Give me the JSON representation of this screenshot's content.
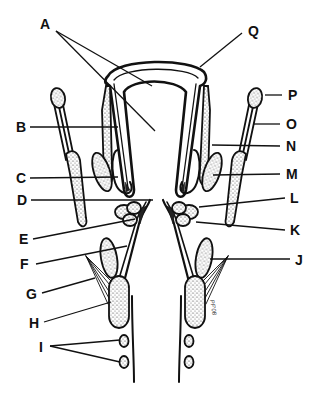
{
  "figure": {
    "type": "anatomical line drawing (coronal section)",
    "background": "#ffffff",
    "ink": "#111111",
    "labels": [
      {
        "id": "A",
        "text": "A",
        "x": 40,
        "y": 29,
        "side": "top-left",
        "targets": [
          [
            152,
            86
          ],
          [
            155,
            131
          ]
        ]
      },
      {
        "id": "B",
        "text": "B",
        "x": 16,
        "y": 131,
        "side": "left",
        "target": [
          118,
          127
        ]
      },
      {
        "id": "C",
        "text": "C",
        "x": 16,
        "y": 182,
        "side": "left",
        "target": [
          118,
          177
        ]
      },
      {
        "id": "D",
        "text": "D",
        "x": 17,
        "y": 205,
        "side": "left",
        "target": [
          153,
          200
        ]
      },
      {
        "id": "E",
        "text": "E",
        "x": 19,
        "y": 243,
        "side": "left",
        "target": [
          135,
          219
        ]
      },
      {
        "id": "F",
        "text": "F",
        "x": 19,
        "y": 268,
        "side": "left",
        "target": [
          127,
          246
        ]
      },
      {
        "id": "G",
        "text": "G",
        "x": 26,
        "y": 298,
        "side": "left",
        "target": [
          95,
          278
        ]
      },
      {
        "id": "H",
        "text": "H",
        "x": 29,
        "y": 327,
        "side": "left",
        "target": [
          111,
          302
        ]
      },
      {
        "id": "I",
        "text": "I",
        "x": 39,
        "y": 351,
        "side": "left",
        "targets": [
          [
            122,
            340
          ],
          [
            121,
            362
          ]
        ]
      },
      {
        "id": "J",
        "text": "J",
        "x": 296,
        "y": 268,
        "side": "right",
        "target": [
          210,
          259
        ]
      },
      {
        "id": "K",
        "text": "K",
        "x": 292,
        "y": 235,
        "side": "right",
        "target": [
          196,
          222
        ]
      },
      {
        "id": "L",
        "text": "L",
        "x": 292,
        "y": 203,
        "side": "right",
        "target": [
          199,
          207
        ]
      },
      {
        "id": "M",
        "text": "M",
        "x": 287,
        "y": 178,
        "side": "right",
        "target": [
          213,
          175
        ]
      },
      {
        "id": "N",
        "text": "N",
        "x": 287,
        "y": 151,
        "side": "right",
        "target": [
          212,
          145
        ]
      },
      {
        "id": "O",
        "text": "O",
        "x": 287,
        "y": 129,
        "side": "right",
        "target": [
          254,
          124
        ]
      },
      {
        "id": "P",
        "text": "P",
        "x": 289,
        "y": 101,
        "side": "right",
        "target": [
          270,
          94
        ]
      },
      {
        "id": "Q",
        "text": "Q",
        "x": 251,
        "y": 35,
        "side": "top-right",
        "target": [
          200,
          67
        ]
      }
    ],
    "signature": "PF'08"
  }
}
